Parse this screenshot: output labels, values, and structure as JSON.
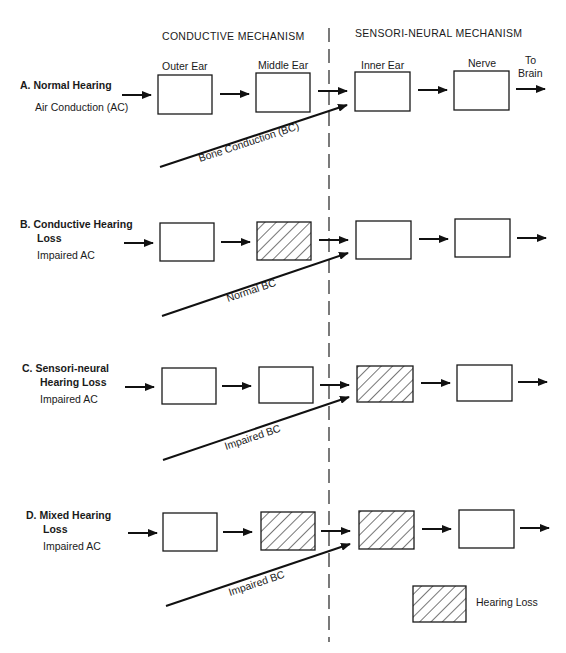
{
  "headers": {
    "conductive": "CONDUCTIVE MECHANISM",
    "sensorineural": "SENSORI-NEURAL MECHANISM"
  },
  "columns": {
    "outer_ear": "Outer Ear",
    "middle_ear": "Middle Ear",
    "inner_ear": "Inner Ear",
    "nerve": "Nerve",
    "to_brain_line1": "To",
    "to_brain_line2": "Brain"
  },
  "rows": [
    {
      "id": "A",
      "title_line1": "A.  Normal Hearing",
      "title_line2": "",
      "ac_label": "Air Conduction (AC)",
      "bc_label": "Bone Conduction (BC)",
      "impaired": {
        "outer_ear": false,
        "middle_ear": false,
        "inner_ear": false,
        "nerve": false
      }
    },
    {
      "id": "B",
      "title_line1": "B.  Conductive Hearing",
      "title_line2": "Loss",
      "ac_label": "Impaired AC",
      "bc_label": "Normal BC",
      "impaired": {
        "outer_ear": false,
        "middle_ear": true,
        "inner_ear": false,
        "nerve": false
      }
    },
    {
      "id": "C",
      "title_line1": "C.  Sensori-neural",
      "title_line2": "Hearing Loss",
      "ac_label": "Impaired AC",
      "bc_label": "Impaired BC",
      "impaired": {
        "outer_ear": false,
        "middle_ear": false,
        "inner_ear": true,
        "nerve": false
      }
    },
    {
      "id": "D",
      "title_line1": "D.  Mixed Hearing",
      "title_line2": "Loss",
      "ac_label": "Impaired AC",
      "bc_label": "Impaired BC",
      "impaired": {
        "outer_ear": false,
        "middle_ear": true,
        "inner_ear": true,
        "nerve": false
      }
    }
  ],
  "legend": {
    "hatched_label": "Hearing Loss"
  },
  "colors": {
    "ink": "#1a1a1a",
    "background": "#ffffff"
  }
}
